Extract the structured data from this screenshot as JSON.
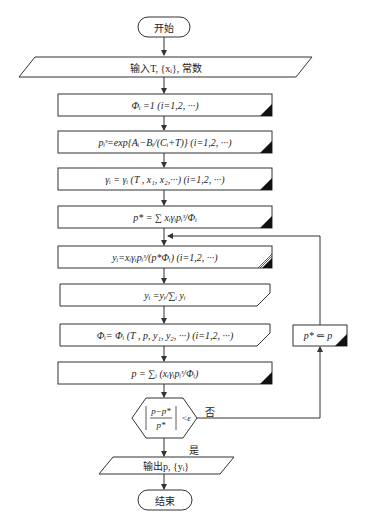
{
  "diagram": {
    "start": {
      "label": "开始"
    },
    "input": {
      "label": "输入T, {xᵢ}, 常数"
    },
    "steps": [
      {
        "id": "init-phi",
        "label": "Φᵢ =1 (i=1,2, ···)"
      },
      {
        "id": "sat-pressure",
        "label": "pᵢˢ=exp{Aᵢ−Bᵢ/(Cᵢ+T)} (i=1,2, ···)"
      },
      {
        "id": "activity",
        "label": "γᵢ = γᵢ (T , x₁, x₂,···) (i=1,2, ···)"
      },
      {
        "id": "p-star",
        "label": "p* = ∑ xᵢγᵢpᵢˢ/Φᵢ"
      },
      {
        "id": "y-calc",
        "label": "yᵢ=xᵢγᵢpᵢˢ/(p*Φᵢ) (i=1,2, ···)"
      },
      {
        "id": "y-normalize",
        "label": "yᵢ =yᵢ/∑ᵢ yᵢ"
      },
      {
        "id": "phi-update",
        "label": "Φᵢ= Φᵢ (T , p, y₁, y₂, ···) (i=1,2, ···)"
      },
      {
        "id": "p-calc",
        "label": "p = ∑ᵢ (xᵢγᵢpᵢˢ/Φᵢ)"
      }
    ],
    "decision": {
      "label": "|(p−p*)/p*| < ε",
      "no": "否",
      "yes": "是"
    },
    "loop_step": {
      "label": "p* ⇐ p"
    },
    "output": {
      "label": "输出p, {yᵢ}"
    },
    "end": {
      "label": "结束"
    }
  }
}
